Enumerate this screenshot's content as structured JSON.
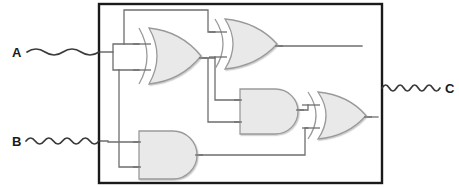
{
  "diagram": {
    "type": "logic-circuit-block-diagram",
    "title": "",
    "colors": {
      "background": "#ffffff",
      "box_border": "#1a1a1a",
      "wire": "#6e6e6e",
      "gate_stroke": "#9a9a9a",
      "gate_fill": "#e9e9e9",
      "signal_stroke": "#3a3a3a",
      "label_text": "#1a1a1a"
    },
    "box": {
      "name": "black-box",
      "x": 99,
      "y": 4,
      "width": 283,
      "height": 179,
      "stroke_width": 2.4,
      "fill": "none"
    },
    "ports": [
      {
        "id": "A",
        "label": "A",
        "role": "input",
        "label_x": 12,
        "label_y": 57,
        "wave_start_x": 27,
        "wave_end_x": 99,
        "wave_y": 52,
        "wave_cycles": 2,
        "wave_amplitude": 6
      },
      {
        "id": "B",
        "label": "B",
        "role": "input",
        "label_x": 12,
        "label_y": 146,
        "wave_start_x": 26,
        "wave_end_x": 99,
        "wave_y": 141,
        "wave_cycles": 4,
        "wave_amplitude": 6
      },
      {
        "id": "C",
        "label": "C",
        "role": "output",
        "label_x": 445,
        "label_y": 93,
        "wave_start_x": 382,
        "wave_end_x": 440,
        "wave_y": 88,
        "wave_cycles": 4,
        "wave_amplitude": 6
      }
    ],
    "gates": [
      {
        "id": "G1",
        "name": "xor-gate-1",
        "type": "XOR",
        "x": 139,
        "y": 28,
        "width": 62,
        "height": 56,
        "inputs": 2,
        "input_points": [
          [
            139,
            44
          ],
          [
            139,
            70
          ]
        ],
        "output_point": [
          201,
          58
        ]
      },
      {
        "id": "G2",
        "name": "xor-gate-2",
        "type": "XOR",
        "x": 215,
        "y": 19,
        "width": 62,
        "height": 50,
        "inputs": 2,
        "input_points": [
          [
            215,
            32
          ],
          [
            215,
            57
          ]
        ],
        "output_point": [
          277,
          46
        ]
      },
      {
        "id": "G3",
        "name": "and-gate-3",
        "type": "AND",
        "x": 240,
        "y": 89,
        "width": 58,
        "height": 45,
        "inputs": 2,
        "input_points": [
          [
            240,
            100
          ],
          [
            240,
            122
          ]
        ],
        "output_point": [
          298,
          110
        ]
      },
      {
        "id": "G4",
        "name": "xor-gate-4",
        "type": "XOR",
        "x": 308,
        "y": 92,
        "width": 58,
        "height": 47,
        "inputs": 2,
        "input_points": [
          [
            308,
            105
          ],
          [
            308,
            128
          ]
        ],
        "output_point": [
          366,
          117
        ]
      },
      {
        "id": "G5",
        "name": "and-gate-5",
        "type": "AND",
        "x": 139,
        "y": 131,
        "width": 58,
        "height": 48,
        "inputs": 2,
        "input_points": [
          [
            139,
            142
          ],
          [
            139,
            167
          ]
        ],
        "output_point": [
          197,
          155
        ]
      }
    ],
    "wires": [
      {
        "name": "wire-a-to-xor1-top",
        "path": "M 99 52 L 113 52 L 113 44 L 139 44"
      },
      {
        "name": "wire-a-branch-down",
        "path": "M 113 52 L 113 70 L 139 70"
      },
      {
        "name": "wire-a-tap-to-top-rail",
        "path": "M 124 44 L 124 10 L 208 10 L 208 32 L 215 32"
      },
      {
        "name": "wire-a-down-to-and5",
        "path": "M 119 70 L 119 167 L 139 167"
      },
      {
        "name": "wire-b-into-box",
        "path": "M 99 141 L 108 141 L 108 142 L 139 142"
      },
      {
        "name": "wire-xor1-out-to-xor2",
        "path": "M 201 58 L 215 58 L 215 57"
      },
      {
        "name": "wire-xor1-out-branch",
        "path": "M 208 58 L 208 122 L 240 122"
      },
      {
        "name": "wire-mid-tap-to-and3",
        "path": "M 215 58 L 215 100 L 240 100"
      },
      {
        "name": "wire-xor2-out",
        "path": "M 277 46 L 362 46"
      },
      {
        "name": "wire-and3-out-to-xor4",
        "path": "M 298 110 L 308 110 L 308 105"
      },
      {
        "name": "wire-and5-out",
        "path": "M 197 155 L 305 155 L 305 128 L 308 128"
      },
      {
        "name": "wire-xor4-out-to-edge",
        "path": "M 366 117 L 378 117"
      }
    ]
  }
}
